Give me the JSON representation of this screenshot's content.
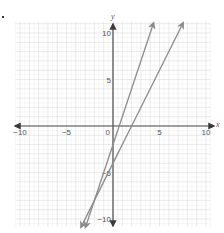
{
  "question_marker": ".",
  "chart_data": {
    "type": "line",
    "title": "",
    "xlabel": "x",
    "ylabel": "y",
    "xlim": [
      -10.5,
      10.5
    ],
    "ylim": [
      -10.8,
      11.2
    ],
    "grid": true,
    "minor_grid": true,
    "x_ticks": [
      {
        "value": -10,
        "label": "−10"
      },
      {
        "value": -5,
        "label": "−5"
      },
      {
        "value": 5,
        "label": "5"
      },
      {
        "value": 10,
        "label": "10"
      }
    ],
    "y_ticks": [
      {
        "value": 10,
        "label": "10"
      },
      {
        "value": 5,
        "label": "5"
      },
      {
        "value": -5,
        "label": "−5"
      },
      {
        "value": -10,
        "label": "−10"
      }
    ],
    "origin_label": "0",
    "series": [
      {
        "name": "line-1",
        "equation": "y = 3x - 2",
        "slope": 3,
        "intercept": -2,
        "x_range": [
          -2.97,
          4.37
        ],
        "color": "#8c8c8c",
        "arrows": "both"
      },
      {
        "name": "line-2",
        "equation": "y = 2x - 4",
        "slope": 2,
        "intercept": -4,
        "x_range": [
          -3.45,
          7.55
        ],
        "color": "#8c8c8c",
        "arrows": "both"
      }
    ],
    "intersection": [
      -2,
      -8
    ]
  },
  "colors": {
    "axis": "#4a4a4a",
    "grid_major": "#dcdcdc",
    "grid_minor": "#efefef",
    "line": "#8c8c8c"
  }
}
